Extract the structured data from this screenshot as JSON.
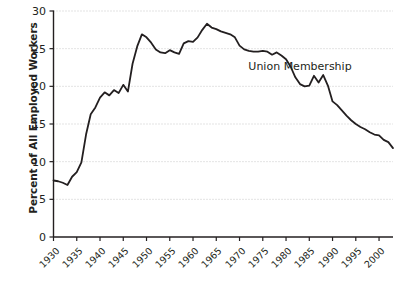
{
  "chart_data": {
    "type": "line",
    "title": "",
    "subtitle": "",
    "xlabel": "",
    "ylabel": "Percent of All Employed Workers",
    "xlim": [
      1930,
      2003
    ],
    "ylim": [
      0,
      30
    ],
    "grid": true,
    "legend_position": "inline-annotation",
    "annotations": [
      {
        "text": "Union Membership",
        "x": 1983,
        "y": 22.6
      }
    ],
    "yticks": [
      0,
      5,
      10,
      15,
      20,
      25,
      30
    ],
    "ytick_labels": [
      "0",
      "5",
      "10",
      "15",
      "20",
      "25",
      "30"
    ],
    "xticks": [
      1930,
      1935,
      1940,
      1945,
      1950,
      1955,
      1960,
      1965,
      1970,
      1975,
      1980,
      1985,
      1990,
      1995,
      2000
    ],
    "xtick_labels": [
      "1930",
      "1935",
      "1940",
      "1945",
      "1950",
      "1955",
      "1960",
      "1965",
      "1970",
      "1975",
      "1980",
      "1985",
      "1990",
      "1995",
      "2000"
    ],
    "series": [
      {
        "name": "Union Membership",
        "color": "#231f20",
        "x": [
          1930,
          1931,
          1932,
          1933,
          1934,
          1935,
          1936,
          1937,
          1938,
          1939,
          1940,
          1941,
          1942,
          1943,
          1944,
          1945,
          1946,
          1947,
          1948,
          1949,
          1950,
          1951,
          1952,
          1953,
          1954,
          1955,
          1956,
          1957,
          1958,
          1959,
          1960,
          1961,
          1962,
          1963,
          1964,
          1965,
          1966,
          1967,
          1968,
          1969,
          1970,
          1971,
          1972,
          1973,
          1974,
          1975,
          1976,
          1977,
          1978,
          1979,
          1980,
          1981,
          1982,
          1983,
          1984,
          1985,
          1986,
          1987,
          1988,
          1989,
          1990,
          1991,
          1992,
          1993,
          1994,
          1995,
          1996,
          1997,
          1998,
          1999,
          2000,
          2001,
          2002,
          2003
        ],
        "y": [
          7.5,
          7.4,
          7.2,
          6.9,
          8.0,
          8.6,
          9.9,
          13.6,
          16.3,
          17.2,
          18.5,
          19.2,
          18.8,
          19.5,
          19.1,
          20.2,
          19.3,
          23.0,
          25.3,
          26.9,
          26.5,
          25.8,
          24.9,
          24.5,
          24.4,
          24.8,
          24.5,
          24.3,
          25.7,
          26.0,
          25.9,
          26.5,
          27.5,
          28.3,
          27.8,
          27.6,
          27.3,
          27.1,
          26.9,
          26.5,
          25.4,
          24.9,
          24.7,
          24.6,
          24.6,
          24.7,
          24.6,
          24.2,
          24.5,
          24.1,
          23.6,
          22.6,
          21.2,
          20.3,
          20.0,
          20.1,
          21.4,
          20.5,
          21.5,
          20.1,
          18.0,
          17.5,
          16.8,
          16.1,
          15.5,
          15.0,
          14.6,
          14.3,
          13.9,
          13.6,
          13.5,
          12.9,
          12.6,
          11.8
        ]
      }
    ]
  }
}
